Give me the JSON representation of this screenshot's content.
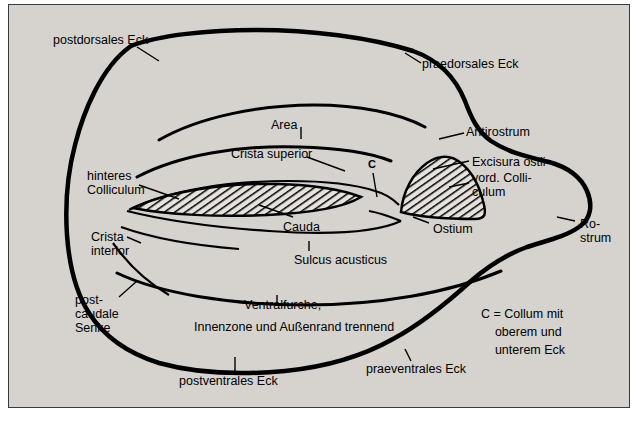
{
  "figure": {
    "background_color": "#d6d3ce",
    "border_color": "#3a3a3a",
    "outline_color": "#000000",
    "hatch_color": "#000000"
  },
  "labels": [
    {
      "id": "postdorsales-eck",
      "text": "postdorsales Eck",
      "x": 44,
      "y": 28,
      "align": "left"
    },
    {
      "id": "praedorsales-eck",
      "text": "praedorsales Eck",
      "x": 413,
      "y": 52,
      "align": "left"
    },
    {
      "id": "area",
      "text": "Area",
      "x": 262,
      "y": 113,
      "align": "left"
    },
    {
      "id": "antirostrum",
      "text": "Antirostrum",
      "x": 457,
      "y": 120,
      "align": "left"
    },
    {
      "id": "crista-superior",
      "text": "Crista superior",
      "x": 222,
      "y": 142,
      "align": "left"
    },
    {
      "id": "excisura-ostii",
      "text": "Excisura ostii",
      "x": 463,
      "y": 150,
      "align": "left"
    },
    {
      "id": "hinteres-colliculum",
      "text": "hinteres\nColliculum",
      "x": 78,
      "y": 164,
      "align": "left"
    },
    {
      "id": "vord-colliculum",
      "text": "vord. Colli-\nculum",
      "x": 463,
      "y": 166,
      "align": "left"
    },
    {
      "id": "c-marker",
      "text": "C",
      "x": 359,
      "y": 152,
      "align": "left"
    },
    {
      "id": "crista-interior",
      "text": "Crista\ninterior",
      "x": 82,
      "y": 225,
      "align": "left"
    },
    {
      "id": "cauda",
      "text": "Cauda",
      "x": 274,
      "y": 215,
      "align": "left"
    },
    {
      "id": "ostium",
      "text": "Ostium",
      "x": 424,
      "y": 217,
      "align": "left"
    },
    {
      "id": "rostrum",
      "text": "Ro-\nstrum",
      "x": 571,
      "y": 212,
      "align": "left"
    },
    {
      "id": "sulcus-acusticus",
      "text": "Sulcus acusticus",
      "x": 285,
      "y": 248,
      "align": "left"
    },
    {
      "id": "postcaudale-senke",
      "text": "post-\ncaudale\nSenke",
      "x": 66,
      "y": 288,
      "align": "left"
    },
    {
      "id": "ventralfurche",
      "text": "Ventralfurche,",
      "x": 235,
      "y": 293,
      "align": "left"
    },
    {
      "id": "innenzone",
      "text": "Innenzone und Außenrand trennend",
      "x": 185,
      "y": 315,
      "align": "left"
    },
    {
      "id": "collum-legend",
      "text": "C = Collum mit\n    oberem und\n    unterem Eck",
      "x": 472,
      "y": 307,
      "align": "left"
    },
    {
      "id": "postventrales-eck",
      "text": "postventrales Eck",
      "x": 170,
      "y": 369,
      "align": "left"
    },
    {
      "id": "praeventrales-eck",
      "text": "praeventrales Eck",
      "x": 357,
      "y": 357,
      "align": "left"
    }
  ]
}
